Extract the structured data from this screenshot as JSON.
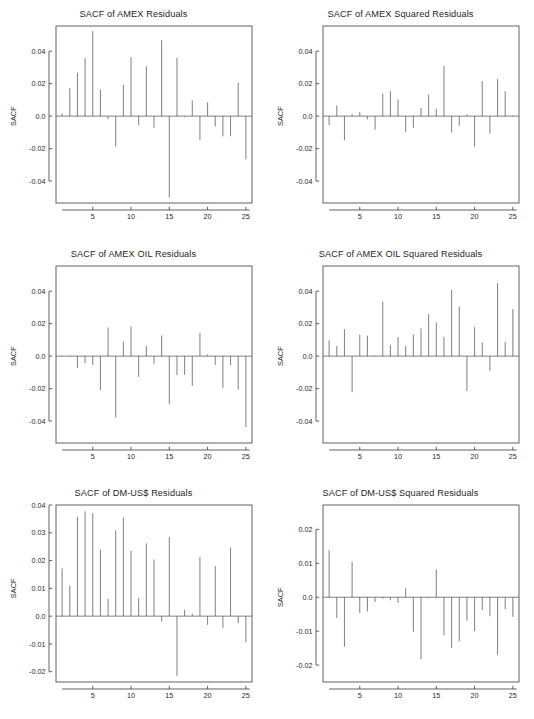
{
  "figure": {
    "background_color": "#ffffff",
    "line_color": "#555555",
    "axis_color": "#3c3c3c",
    "text_color": "#1f1f1f",
    "rows": 3,
    "cols": 2
  },
  "panels": [
    {
      "id": "amex-residuals",
      "title": "SACF of AMEX Residuals",
      "ylabel": "SACF",
      "yticks": [
        "0.04",
        "0.02",
        "0.0",
        "-0.02",
        "-0.04"
      ],
      "xticks": [
        "5",
        "10",
        "15",
        "20",
        "25"
      ]
    },
    {
      "id": "amex-squared-residuals",
      "title": "SACF of AMEX Squared Residuals",
      "ylabel": "SACF",
      "yticks": [
        "0.04",
        "0.02",
        "0.0",
        "-0.02",
        "-0.04"
      ],
      "xticks": [
        "5",
        "10",
        "15",
        "20",
        "25"
      ]
    },
    {
      "id": "amex-oil-residuals",
      "title": "SACF of AMEX OIL Residuals",
      "ylabel": "SACF",
      "yticks": [
        "0.04",
        "0.02",
        "0.0",
        "-0.02",
        "-0.04"
      ],
      "xticks": [
        "5",
        "10",
        "15",
        "20",
        "25"
      ]
    },
    {
      "id": "amex-oil-squared-residuals",
      "title": "SACF of AMEX OIL Squared Residuals",
      "ylabel": "SACF",
      "yticks": [
        "0.04",
        "0.02",
        "0.0",
        "-0.02",
        "-0.04"
      ],
      "xticks": [
        "5",
        "10",
        "15",
        "20",
        "25"
      ]
    },
    {
      "id": "dm-usd-residuals",
      "title": "SACF of DM-US$ Residuals",
      "ylabel": "SACF",
      "yticks": [
        "0.04",
        "0.03",
        "0.02",
        "0.01",
        "0.0",
        "-0.01",
        "-0.02"
      ],
      "xticks": [
        "5",
        "10",
        "15",
        "20",
        "25"
      ]
    },
    {
      "id": "dm-usd-squared-residuals",
      "title": "SACF of DM-US$ Squared Residuals",
      "ylabel": "SACF",
      "yticks": [
        "0.02",
        "0.01",
        "0.0",
        "-0.01",
        "-0.02"
      ],
      "xticks": [
        "5",
        "10",
        "15",
        "20",
        "25"
      ]
    }
  ],
  "chart_data": [
    {
      "type": "bar",
      "id": "amex-residuals",
      "title": "SACF of AMEX Residuals",
      "xlabel": "",
      "ylabel": "SACF",
      "grid": false,
      "legend": null,
      "xlim": [
        0.2,
        25.8
      ],
      "ylim": [
        -0.0535,
        0.0555
      ],
      "ytick_values": [
        0.04,
        0.02,
        0.0,
        -0.02,
        -0.04
      ],
      "xtick_values": [
        5,
        10,
        15,
        20,
        25
      ],
      "categories": [
        1,
        2,
        3,
        4,
        5,
        6,
        7,
        8,
        9,
        10,
        11,
        12,
        13,
        14,
        15,
        16,
        17,
        18,
        19,
        20,
        21,
        22,
        23,
        24,
        25
      ],
      "values": [
        0.0017,
        0.0172,
        0.0267,
        0.0358,
        0.0524,
        0.0164,
        -0.0019,
        -0.0188,
        0.0193,
        0.0363,
        -0.0054,
        0.0307,
        -0.0072,
        0.0468,
        -0.05,
        0.0359,
        -0.0006,
        0.0097,
        -0.0148,
        0.0085,
        -0.0064,
        -0.0125,
        -0.0124,
        0.0205,
        -0.0266
      ]
    },
    {
      "type": "bar",
      "id": "amex-squared-residuals",
      "title": "SACF of AMEX Squared Residuals",
      "xlabel": "",
      "ylabel": "SACF",
      "grid": false,
      "legend": null,
      "xlim": [
        0.2,
        25.8
      ],
      "ylim": [
        -0.0535,
        0.0555
      ],
      "ytick_values": [
        0.04,
        0.02,
        0.0,
        -0.02,
        -0.04
      ],
      "xtick_values": [
        5,
        10,
        15,
        20,
        25
      ],
      "categories": [
        1,
        2,
        3,
        4,
        5,
        6,
        7,
        8,
        9,
        10,
        11,
        12,
        13,
        14,
        15,
        16,
        17,
        18,
        19,
        20,
        21,
        22,
        23,
        24,
        25
      ],
      "values": [
        -0.0055,
        0.0066,
        -0.0147,
        0.0011,
        0.0026,
        -0.002,
        -0.0084,
        0.0139,
        0.0154,
        0.0103,
        -0.0099,
        -0.0072,
        0.005,
        0.0133,
        0.0045,
        0.031,
        -0.0101,
        -0.006,
        0.001,
        -0.0188,
        0.0216,
        -0.0108,
        0.0228,
        0.0153,
        0.0004
      ]
    },
    {
      "type": "bar",
      "id": "amex-oil-residuals",
      "title": "SACF of AMEX OIL Residuals",
      "xlabel": "",
      "ylabel": "SACF",
      "grid": false,
      "legend": null,
      "xlim": [
        0.2,
        25.8
      ],
      "ylim": [
        -0.0535,
        0.0555
      ],
      "ytick_values": [
        0.04,
        0.02,
        0.0,
        -0.02,
        -0.04
      ],
      "xtick_values": [
        5,
        10,
        15,
        20,
        25
      ],
      "categories": [
        1,
        2,
        3,
        4,
        5,
        6,
        7,
        8,
        9,
        10,
        11,
        12,
        13,
        14,
        15,
        16,
        17,
        18,
        19,
        20,
        21,
        22,
        23,
        24,
        25
      ],
      "values": [
        -0.0004,
        -0.0006,
        -0.0073,
        -0.0044,
        -0.0055,
        -0.021,
        0.0176,
        -0.0379,
        0.0089,
        0.0183,
        -0.0128,
        0.0063,
        -0.0047,
        0.0127,
        -0.0296,
        -0.0117,
        -0.0115,
        -0.0183,
        0.0144,
        0.001,
        -0.0054,
        -0.0196,
        -0.0056,
        -0.0207,
        -0.0437
      ]
    },
    {
      "type": "bar",
      "id": "amex-oil-squared-residuals",
      "title": "SACF of AMEX OIL Squared Residuals",
      "xlabel": "",
      "ylabel": "SACF",
      "grid": false,
      "legend": null,
      "xlim": [
        0.2,
        25.8
      ],
      "ylim": [
        -0.0535,
        0.0555
      ],
      "ytick_values": [
        0.04,
        0.02,
        0.0,
        -0.02,
        -0.04
      ],
      "xtick_values": [
        5,
        10,
        15,
        20,
        25
      ],
      "categories": [
        1,
        2,
        3,
        4,
        5,
        6,
        7,
        8,
        9,
        10,
        11,
        12,
        13,
        14,
        15,
        16,
        17,
        18,
        19,
        20,
        21,
        22,
        23,
        24,
        25
      ],
      "values": [
        0.0097,
        0.0063,
        0.0166,
        -0.0222,
        0.0132,
        0.0126,
        0.0003,
        0.0336,
        0.0069,
        0.0117,
        0.0063,
        0.0134,
        0.0171,
        0.0259,
        0.0206,
        0.0119,
        0.0409,
        0.0305,
        -0.0215,
        0.0178,
        0.0084,
        -0.0091,
        0.045,
        0.0086,
        0.029
      ]
    },
    {
      "type": "bar",
      "id": "dm-usd-residuals",
      "title": "SACF of DM-US$ Residuals",
      "xlabel": "",
      "ylabel": "SACF",
      "grid": false,
      "legend": null,
      "xlim": [
        0.2,
        25.8
      ],
      "ylim": [
        -0.0237,
        0.04
      ],
      "ytick_values": [
        0.04,
        0.03,
        0.02,
        0.01,
        0.0,
        -0.01,
        -0.02
      ],
      "xtick_values": [
        5,
        10,
        15,
        20,
        25
      ],
      "categories": [
        1,
        2,
        3,
        4,
        5,
        6,
        7,
        8,
        9,
        10,
        11,
        12,
        13,
        14,
        15,
        16,
        17,
        18,
        19,
        20,
        21,
        22,
        23,
        24,
        25
      ],
      "values": [
        0.0172,
        0.011,
        0.0358,
        0.0377,
        0.0371,
        0.0239,
        0.0062,
        0.0309,
        0.0356,
        0.0235,
        0.0065,
        0.0262,
        0.0204,
        -0.0019,
        0.0285,
        -0.0215,
        0.0023,
        0.0009,
        0.0213,
        -0.0031,
        0.018,
        -0.0042,
        0.0247,
        -0.0025,
        -0.0094
      ]
    },
    {
      "type": "bar",
      "id": "dm-usd-squared-residuals",
      "title": "SACF of DM-US$ Squared Residuals",
      "xlabel": "",
      "ylabel": "SACF",
      "grid": false,
      "legend": null,
      "xlim": [
        0.2,
        25.8
      ],
      "ylim": [
        -0.025,
        0.0272
      ],
      "ytick_values": [
        0.02,
        0.01,
        0.0,
        -0.01,
        -0.02
      ],
      "xtick_values": [
        5,
        10,
        15,
        20,
        25
      ],
      "categories": [
        1,
        2,
        3,
        4,
        5,
        6,
        7,
        8,
        9,
        10,
        11,
        12,
        13,
        14,
        15,
        16,
        17,
        18,
        19,
        20,
        21,
        22,
        23,
        24,
        25
      ],
      "values": [
        0.0139,
        -0.0061,
        -0.0146,
        0.0104,
        -0.0046,
        -0.0042,
        -0.0014,
        -0.0004,
        -0.0009,
        -0.0017,
        0.0026,
        -0.0102,
        -0.0183,
        -0.0002,
        0.0082,
        -0.0112,
        -0.015,
        -0.013,
        -0.0069,
        -0.01,
        -0.0038,
        -0.0056,
        -0.017,
        -0.0035,
        -0.0058
      ]
    }
  ]
}
